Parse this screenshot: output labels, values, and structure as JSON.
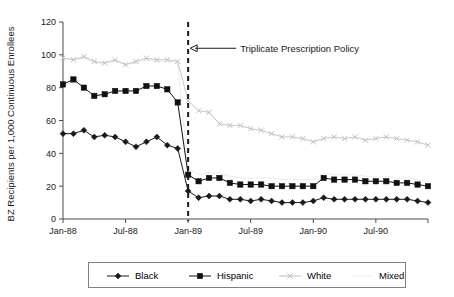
{
  "chart_data": {
    "type": "line",
    "title": "",
    "xlabel": "",
    "ylabel": "BZ Recipients per 1,000 Continuous Enrollees",
    "ylim": [
      0,
      120
    ],
    "y_ticks": [
      0,
      20,
      40,
      60,
      80,
      100,
      120
    ],
    "grid": false,
    "legend_position": "bottom",
    "x_tick_labels": [
      "Jan-88",
      "Jul-88",
      "Jan-89",
      "Jul-89",
      "Jan-90",
      "Jul-90"
    ],
    "x_tick_months": [
      0,
      6,
      12,
      18,
      24,
      30
    ],
    "x_range_months": [
      0,
      35
    ],
    "annotations": [
      {
        "label": "Triplicate Prescription Policy",
        "at_month": 12,
        "at_value": 104,
        "type": "vertical-dashed-line-with-arrow"
      }
    ],
    "series": [
      {
        "name": "Black",
        "marker": "diamond",
        "color": "#1a1a1a",
        "values": [
          52,
          52,
          54,
          50,
          51,
          50,
          47,
          44,
          47,
          50,
          45,
          43,
          17,
          13,
          14,
          14,
          12,
          12,
          11,
          12,
          11,
          10,
          10,
          10,
          11,
          13,
          12,
          12,
          12,
          12,
          12,
          12,
          12,
          12,
          11,
          10
        ]
      },
      {
        "name": "Hispanic",
        "marker": "square",
        "color": "#111111",
        "values": [
          82,
          85,
          80,
          75,
          76,
          78,
          78,
          78,
          81,
          81,
          79,
          71,
          27,
          23,
          25,
          25,
          22,
          21,
          21,
          21,
          20,
          20,
          20,
          20,
          20,
          25,
          24,
          24,
          24,
          23,
          23,
          23,
          22,
          22,
          21,
          20
        ]
      },
      {
        "name": "White",
        "marker": "cross",
        "color": "#bfbfbf",
        "values": [
          98,
          97,
          99,
          96,
          95,
          97,
          94,
          96,
          98,
          97,
          97,
          96,
          72,
          66,
          65,
          58,
          57,
          57,
          55,
          54,
          52,
          50,
          50,
          49,
          47,
          49,
          50,
          49,
          50,
          48,
          49,
          50,
          49,
          48,
          47,
          45
        ]
      },
      {
        "name": "Mixed",
        "marker": "none",
        "color": "#ececec",
        "values": [
          98,
          97,
          98,
          95,
          95,
          96,
          94,
          95,
          97,
          96,
          96,
          95,
          31,
          27,
          28,
          28,
          26,
          25,
          25,
          25,
          25,
          24,
          24,
          24,
          24,
          28,
          27,
          27,
          27,
          26,
          26,
          26,
          25,
          25,
          24,
          23
        ]
      }
    ]
  },
  "legend": {
    "items": [
      {
        "label": "Black",
        "marker": "diamond",
        "color": "#1a1a1a"
      },
      {
        "label": "Hispanic",
        "marker": "square",
        "color": "#111111"
      },
      {
        "label": "White",
        "marker": "cross",
        "color": "#bfbfbf"
      },
      {
        "label": "Mixed",
        "marker": "none",
        "color": "#ececec"
      }
    ]
  },
  "colors": {
    "axis": "#4d4d4d",
    "text": "#1a1a1a",
    "event_line": "#1a1a1a",
    "background": "#ffffff"
  }
}
